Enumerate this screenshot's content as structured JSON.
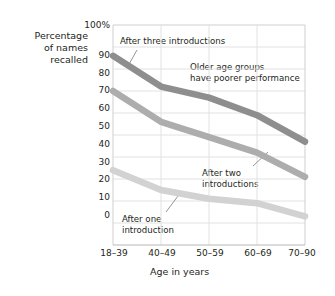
{
  "chart_data": {
    "type": "line",
    "title": "",
    "xlabel": "Age in years",
    "ylabel": "Percentage\nof names\nrecalled",
    "categories": [
      "18–39",
      "40–49",
      "50–59",
      "60–69",
      "70–90"
    ],
    "yticks": [
      "0",
      "10",
      "20",
      "30",
      "40",
      "50",
      "60",
      "70",
      "80",
      "90",
      "100%"
    ],
    "ylim": [
      0,
      100
    ],
    "grid": true,
    "legend": "none",
    "series": [
      {
        "name": "After three introductions",
        "color": "#8e8e8e",
        "values": [
          86,
          72,
          67,
          59,
          47
        ]
      },
      {
        "name": "After two introductions",
        "color": "#adadad",
        "values": [
          70,
          56,
          49,
          42,
          31
        ]
      },
      {
        "name": "After one introduction",
        "color": "#d2d2d2",
        "values": [
          34,
          25,
          21,
          19,
          13
        ]
      }
    ],
    "annotations": [
      {
        "id": "after-three",
        "text": "After three introductions"
      },
      {
        "id": "older-groups",
        "text": "Older age groups\nhave poorer performance"
      },
      {
        "id": "after-two",
        "text": "After two\nintroductions"
      },
      {
        "id": "after-one",
        "text": "After one\nintroduction"
      }
    ]
  },
  "axis": {
    "y_label": "Percentage\nof names\nrecalled",
    "x_label": "Age in years"
  },
  "colors": {
    "grid": "#d8d8d8",
    "axis": "#b3b3b3",
    "text": "#231f20",
    "series_three": "#8e8e8e",
    "series_two": "#adadad",
    "series_one": "#d2d2d2"
  }
}
